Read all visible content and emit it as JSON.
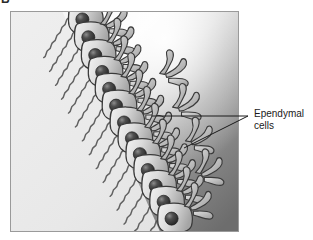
{
  "figure": {
    "panel_letter": "B",
    "style": "grayscale-line-drawing"
  },
  "panel": {
    "name": "illustration-panel",
    "x": 10,
    "y": 11,
    "width": 229,
    "height": 221,
    "border_color": "#9a9a9a"
  },
  "callout": {
    "label_line_1": "Ependymal",
    "label_line_2": "cells",
    "leader_lines": [
      {
        "name": "leader-line-upper",
        "x1": 248,
        "y1": 116,
        "x2": 152,
        "y2": 116
      },
      {
        "name": "leader-line-lower",
        "x1": 248,
        "y1": 116,
        "x2": 184,
        "y2": 148
      }
    ]
  },
  "colors": {
    "background": "#ffffff",
    "panel_light": "#ededed",
    "panel_highlight": "#fbfbfb",
    "panel_mid": "#b4b4b4",
    "panel_dark": "#6e6e6e",
    "cell_body_light": "#e4e4e4",
    "cell_body_shade": "#9f9f9f",
    "nucleus_dark": "#2f2f2f",
    "outline": "#3a3a3a",
    "text": "#1a1a1a"
  },
  "structures": [
    {
      "name": "ventricular-lumen",
      "description": "pale flat region, lower-left half of panel"
    },
    {
      "name": "ependymal-cell-row",
      "description": "diagonal row of columnar ependymal cells",
      "cell_count": 13
    },
    {
      "name": "cell-nucleus",
      "description": "dark spherical nucleus inside each ependymal cell"
    },
    {
      "name": "apical-cilia-tufts",
      "description": "branching cilia projecting to the upper-right into the ventricle"
    },
    {
      "name": "basal-processes",
      "description": "wavy zigzag basal processes extending to the lower-left"
    },
    {
      "name": "neural-tissue-gradient",
      "description": "graded gray tissue filling the upper-right of the panel"
    }
  ]
}
